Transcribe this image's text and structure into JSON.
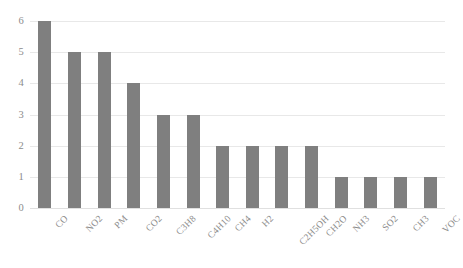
{
  "chart_data": {
    "type": "bar",
    "title": "",
    "subtitle": "",
    "xlabel": "",
    "ylabel": "",
    "categories": [
      "CO",
      "NO2",
      "PM",
      "CO2",
      "C3H8",
      "C4H10",
      "CH4",
      "H2",
      "C2H5OH",
      "CH2O",
      "NH3",
      "SO2",
      "CH3",
      "VOC"
    ],
    "values": [
      6,
      5,
      5,
      4,
      3,
      3,
      2,
      2,
      2,
      2,
      1,
      1,
      1,
      1
    ],
    "ylim": [
      0,
      6
    ],
    "ytick_labels": [
      "0",
      "1",
      "2",
      "3",
      "4",
      "5",
      "6"
    ],
    "ytick_values": [
      0,
      1,
      2,
      3,
      4,
      5,
      6
    ],
    "grid": true,
    "grid_axis": "y",
    "legend": false,
    "legend_position": "none",
    "bar_color": "#7f7f7f",
    "grid_color": "#e8e8e8",
    "axis_text_color": "#8c8c8c",
    "background_color": "#ffffff",
    "xtick_rotation": -45
  }
}
